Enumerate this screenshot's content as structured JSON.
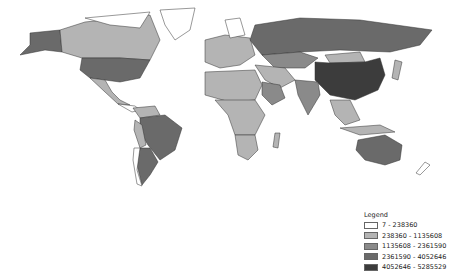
{
  "map": {
    "type": "choropleth",
    "projection": "world",
    "colors": [
      "#ffffff",
      "#b4b4b4",
      "#8a8a8a",
      "#6a6a6a",
      "#3c3c3c"
    ]
  },
  "legend": {
    "title": "Legend",
    "classes": [
      {
        "label": "7 - 238360",
        "color": "#ffffff"
      },
      {
        "label": "238360 - 1135608",
        "color": "#b4b4b4"
      },
      {
        "label": "1135608 - 2361590",
        "color": "#8a8a8a"
      },
      {
        "label": "2361590 - 4052646",
        "color": "#6a6a6a"
      },
      {
        "label": "4052646 - 5285529",
        "color": "#3c3c3c"
      }
    ]
  }
}
